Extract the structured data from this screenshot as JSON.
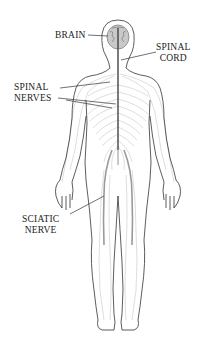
{
  "diagram": {
    "labels": {
      "brain": "BRAIN",
      "spinal_cord": [
        "SPINAL",
        "CORD"
      ],
      "spinal_nerves": [
        "SPINAL",
        "NERVES"
      ],
      "sciatic_nerve": [
        "SCIATIC",
        "NERVE"
      ]
    },
    "colors": {
      "outline": "#333333",
      "nerves": "#9a9a9a",
      "nerves_light": "#c8c8c8",
      "spinal_cord": "#444444",
      "brain": "#777777",
      "text": "#222222",
      "background": "#ffffff"
    }
  }
}
